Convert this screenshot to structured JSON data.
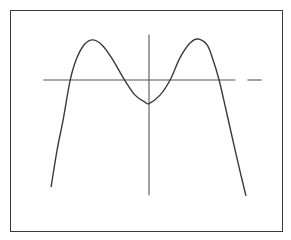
{
  "chart_data": {
    "type": "line",
    "title": "",
    "xlabel": "",
    "ylabel": "",
    "grid": false,
    "axes": {
      "x_axis": {
        "range": [
          -4.4,
          4.7
        ],
        "style": "solid line, dashed at right end"
      },
      "y_axis": {
        "range": [
          -4.8,
          1.9
        ]
      }
    },
    "series": [
      {
        "name": "f(x)",
        "x": [
          -4.08,
          -3.83,
          -3.58,
          -3.29,
          -3.04,
          -2.71,
          -2.33,
          -1.92,
          -1.5,
          -1.04,
          -0.58,
          -0.17,
          0.0,
          0.46,
          0.88,
          1.29,
          1.71,
          2.04,
          2.42,
          2.67,
          2.92,
          3.21,
          3.54,
          3.83,
          4.04
        ],
        "y": [
          -4.46,
          -2.92,
          -1.67,
          -0.04,
          0.83,
          1.46,
          1.67,
          1.42,
          0.83,
          0.04,
          -0.63,
          -0.92,
          -0.98,
          -0.63,
          0.0,
          0.92,
          1.54,
          1.71,
          1.46,
          0.83,
          0.0,
          -1.25,
          -2.71,
          -3.96,
          -4.83
        ]
      }
    ],
    "key_points": {
      "x_intercepts": [
        -3.29,
        -1.04,
        0.88,
        2.92
      ],
      "local_maxima": [
        [
          -2.33,
          1.67
        ],
        [
          2.04,
          1.71
        ]
      ],
      "local_minimum": [
        0.0,
        -0.98
      ]
    },
    "colors": {
      "curve": "#3a3a3a",
      "axes": "#555555",
      "frame": "#3a3a3a"
    }
  }
}
